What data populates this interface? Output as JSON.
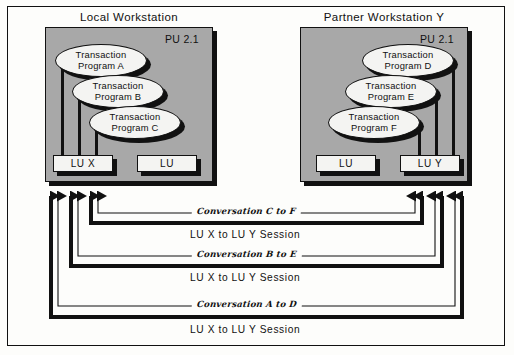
{
  "diagram": {
    "type": "network-architecture-diagram"
  },
  "workstations": [
    {
      "id": "local",
      "title": "Local Workstation",
      "pu_label": "PU 2.1",
      "programs": [
        {
          "line1": "Transaction",
          "line2": "Program A"
        },
        {
          "line1": "Transaction",
          "line2": "Program B"
        },
        {
          "line1": "Transaction",
          "line2": "Program C"
        }
      ],
      "logical_units": [
        {
          "label": "LU X"
        },
        {
          "label": "LU"
        }
      ]
    },
    {
      "id": "partner",
      "title": "Partner Workstation Y",
      "pu_label": "PU 2.1",
      "programs": [
        {
          "line1": "Transaction",
          "line2": "Program D"
        },
        {
          "line1": "Transaction",
          "line2": "Program E"
        },
        {
          "line1": "Transaction",
          "line2": "Program F"
        }
      ],
      "logical_units": [
        {
          "label": "LU"
        },
        {
          "label": "LU Y"
        }
      ]
    }
  ],
  "connections": [
    {
      "conversation": "Conversation C to F",
      "session": "LU X to LU Y Session"
    },
    {
      "conversation": "Conversation B to E",
      "session": "LU X to LU Y Session"
    },
    {
      "conversation": "Conversation A to D",
      "session": "LU X to LU Y Session"
    }
  ],
  "colors": {
    "workstation_fill": "#a8a8a8",
    "node_fill": "#f4f4f2",
    "line": "#111111",
    "background": "#fdfdfb"
  }
}
